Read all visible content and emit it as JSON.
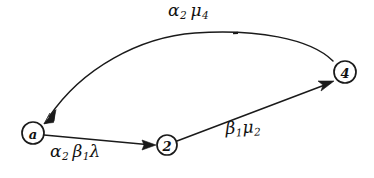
{
  "diagram": {
    "kind": "signal-flow-graph",
    "background_color": "#ffffff",
    "ink_color": "#1a1a1a",
    "nodes": [
      {
        "id": "a",
        "label": "a",
        "cx": 33,
        "cy": 133,
        "r": 11
      },
      {
        "id": "2",
        "label": "2",
        "cx": 167,
        "cy": 145,
        "r": 10
      },
      {
        "id": "4",
        "label": "4",
        "cx": 345,
        "cy": 72,
        "r": 11
      }
    ],
    "edges": [
      {
        "id": "a-to-2",
        "from": "a",
        "to": "2",
        "shape": "straight",
        "label_parts": {
          "g1": "α",
          "s1": "2",
          "g2": "β",
          "s2": "1",
          "g3": "λ"
        },
        "label_text": "α2 β1λ"
      },
      {
        "id": "2-to-4",
        "from": "2",
        "to": "4",
        "shape": "straight",
        "label_parts": {
          "g1": "β",
          "s1": "1",
          "g2": "μ",
          "s2": "2"
        },
        "label_text": "β1μ2"
      },
      {
        "id": "4-to-a",
        "from": "4",
        "to": "a",
        "shape": "arc-over-top",
        "label_parts": {
          "g1": "α",
          "s1": "2",
          "g2": "μ",
          "s2": "4"
        },
        "label_text": "α2 μ4"
      }
    ]
  }
}
